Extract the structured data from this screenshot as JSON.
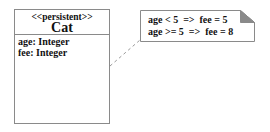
{
  "diagram": {
    "type": "uml-class-with-note",
    "class": {
      "stereotype": "<<persistent>>",
      "name": "Cat",
      "attributes": [
        "age: Integer",
        "fee: Integer"
      ]
    },
    "note": {
      "lines": [
        "age < 5  =>  fee = 5",
        "age >= 5  =>  fee = 8"
      ]
    },
    "connector": {
      "style": "dashed",
      "from": "class-Cat",
      "to": "note"
    },
    "colors": {
      "border": "#8a8a8a",
      "fold": "#8a8a8a",
      "text": "#111111",
      "background": "#ffffff"
    }
  }
}
